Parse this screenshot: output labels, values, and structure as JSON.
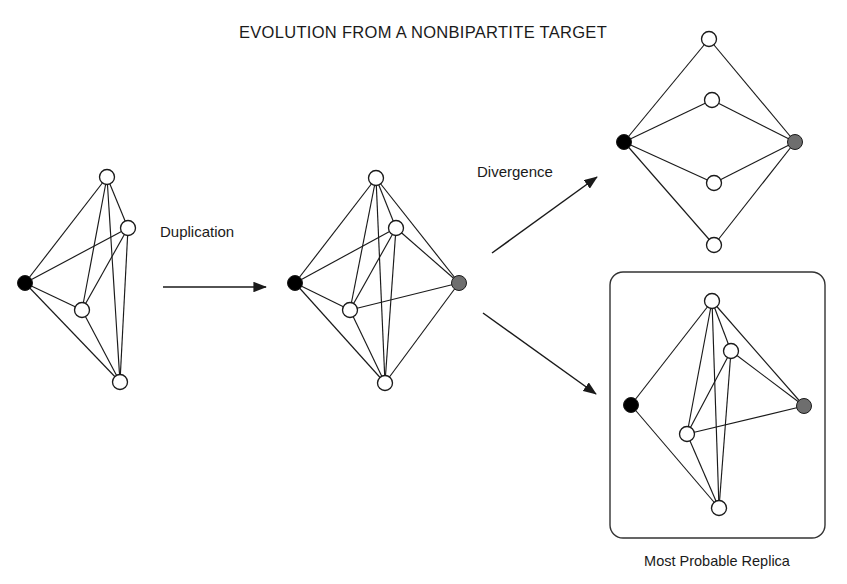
{
  "figure": {
    "title": "EVOLUTION FROM A NONBIPARTITE TARGET",
    "caption": "Most Probable Replica",
    "arrow_labels": {
      "duplication": "Duplication",
      "divergence": "Divergence"
    },
    "colors": {
      "stroke": "#1a1a1a",
      "node_fill_open": "#ffffff",
      "node_fill_black": "#000000",
      "node_fill_gray": "#6e6e6e",
      "background": "#ffffff",
      "box_border": "#333333"
    },
    "node_radius": 7.5,
    "panels": [
      {
        "id": "target-graph",
        "name": "Target graph (nonbipartite)",
        "nodes": [
          {
            "id": "a",
            "x": 25,
            "y": 283,
            "fill": "black"
          },
          {
            "id": "b",
            "x": 107,
            "y": 177,
            "fill": "open"
          },
          {
            "id": "c",
            "x": 128,
            "y": 228,
            "fill": "open"
          },
          {
            "id": "d",
            "x": 82,
            "y": 310,
            "fill": "open"
          },
          {
            "id": "e",
            "x": 120,
            "y": 382,
            "fill": "open"
          }
        ],
        "edges": [
          [
            "a",
            "b"
          ],
          [
            "a",
            "c"
          ],
          [
            "a",
            "d"
          ],
          [
            "a",
            "e"
          ],
          [
            "b",
            "c"
          ],
          [
            "b",
            "d"
          ],
          [
            "b",
            "e"
          ],
          [
            "c",
            "d"
          ],
          [
            "c",
            "e"
          ],
          [
            "d",
            "e"
          ]
        ]
      },
      {
        "id": "duplicated-graph",
        "name": "Duplicated graph",
        "nodes": [
          {
            "id": "a",
            "x": 295,
            "y": 283,
            "fill": "black"
          },
          {
            "id": "b",
            "x": 376,
            "y": 178,
            "fill": "open"
          },
          {
            "id": "c",
            "x": 396,
            "y": 228,
            "fill": "open"
          },
          {
            "id": "d",
            "x": 350,
            "y": 310,
            "fill": "open"
          },
          {
            "id": "e",
            "x": 385,
            "y": 383,
            "fill": "open"
          },
          {
            "id": "f",
            "x": 459,
            "y": 283,
            "fill": "gray"
          }
        ],
        "edges": [
          [
            "a",
            "b"
          ],
          [
            "a",
            "c"
          ],
          [
            "a",
            "d"
          ],
          [
            "a",
            "e"
          ],
          [
            "b",
            "c"
          ],
          [
            "b",
            "d"
          ],
          [
            "b",
            "e"
          ],
          [
            "c",
            "d"
          ],
          [
            "c",
            "e"
          ],
          [
            "d",
            "e"
          ],
          [
            "f",
            "b"
          ],
          [
            "f",
            "c"
          ],
          [
            "f",
            "d"
          ],
          [
            "f",
            "e"
          ]
        ]
      },
      {
        "id": "bipartite-graph",
        "name": "Bipartite divergence outcome",
        "nodes": [
          {
            "id": "a",
            "x": 624,
            "y": 142,
            "fill": "black"
          },
          {
            "id": "b",
            "x": 709,
            "y": 39,
            "fill": "open"
          },
          {
            "id": "c",
            "x": 712,
            "y": 100,
            "fill": "open"
          },
          {
            "id": "d",
            "x": 714,
            "y": 183,
            "fill": "open"
          },
          {
            "id": "e",
            "x": 714,
            "y": 245,
            "fill": "open"
          },
          {
            "id": "f",
            "x": 795,
            "y": 142,
            "fill": "gray"
          }
        ],
        "edges": [
          [
            "a",
            "b"
          ],
          [
            "a",
            "c"
          ],
          [
            "a",
            "d"
          ],
          [
            "a",
            "e"
          ],
          [
            "f",
            "b"
          ],
          [
            "f",
            "c"
          ],
          [
            "f",
            "d"
          ],
          [
            "f",
            "e"
          ]
        ]
      },
      {
        "id": "replica-graph",
        "name": "Most probable replica graph",
        "boxed": true,
        "box": {
          "x": 610,
          "y": 272,
          "width": 215,
          "height": 266,
          "radius": 13
        },
        "nodes": [
          {
            "id": "a",
            "x": 631,
            "y": 405,
            "fill": "black"
          },
          {
            "id": "b",
            "x": 712,
            "y": 301,
            "fill": "open"
          },
          {
            "id": "c",
            "x": 731,
            "y": 351,
            "fill": "open"
          },
          {
            "id": "d",
            "x": 687,
            "y": 434,
            "fill": "open"
          },
          {
            "id": "e",
            "x": 719,
            "y": 508,
            "fill": "open"
          },
          {
            "id": "f",
            "x": 804,
            "y": 406,
            "fill": "gray"
          }
        ],
        "edges": [
          [
            "a",
            "b"
          ],
          [
            "a",
            "e"
          ],
          [
            "b",
            "c"
          ],
          [
            "b",
            "d"
          ],
          [
            "b",
            "e"
          ],
          [
            "b",
            "f"
          ],
          [
            "c",
            "d"
          ],
          [
            "c",
            "e"
          ],
          [
            "c",
            "f"
          ],
          [
            "d",
            "e"
          ],
          [
            "d",
            "f"
          ]
        ]
      }
    ],
    "arrows": [
      {
        "id": "duplication-arrow",
        "x1": 163,
        "y1": 287,
        "x2": 266,
        "y2": 287
      },
      {
        "id": "divergence-up-arrow",
        "x1": 492,
        "y1": 253,
        "x2": 597,
        "y2": 177
      },
      {
        "id": "divergence-down-arrow",
        "x1": 483,
        "y1": 313,
        "x2": 596,
        "y2": 394
      }
    ],
    "label_positions": {
      "title": {
        "x": 423,
        "y": 38
      },
      "duplication": {
        "x": 160,
        "y": 237
      },
      "divergence": {
        "x": 477,
        "y": 177
      },
      "caption": {
        "x": 717,
        "y": 566
      }
    }
  }
}
